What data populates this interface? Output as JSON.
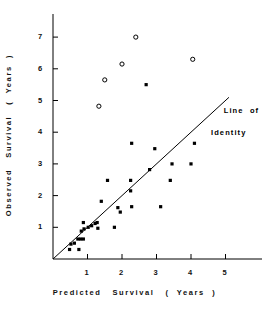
{
  "chart_data": {
    "type": "scatter",
    "title": "",
    "xlabel": "Predicted   Survival   (  Years  )",
    "ylabel": "Observed   Survival   (  Years  )",
    "xlim": [
      0,
      5.6
    ],
    "ylim": [
      0,
      7.35
    ],
    "xticks": [
      1,
      2,
      3,
      4,
      5
    ],
    "yticks": [
      1,
      2,
      3,
      4,
      5,
      6,
      7
    ],
    "xtick_labels": [
      "1",
      "2",
      "3",
      "4",
      "5"
    ],
    "ytick_labels": [
      "1",
      "2",
      "3",
      "4",
      "5",
      "6",
      "7"
    ],
    "grid": false,
    "legend": null,
    "annotations": [
      {
        "name": "line-of-identity",
        "line1": "Line  of",
        "line2": "Identity",
        "x": 4.6,
        "y": 5.05
      }
    ],
    "reference_line": {
      "name": "line-of-identity",
      "label": "Line of Identity",
      "slope": 1,
      "intercept": 0,
      "x_start": 0.0,
      "x_end": 5.1,
      "color": "#000000"
    },
    "series": [
      {
        "name": "Observed survival (filled)",
        "marker": "filled-square",
        "color": "#000000",
        "points": [
          [
            0.48,
            0.3
          ],
          [
            0.52,
            0.47
          ],
          [
            0.62,
            0.5
          ],
          [
            0.72,
            0.63
          ],
          [
            0.75,
            0.3
          ],
          [
            0.8,
            0.63
          ],
          [
            0.88,
            0.63
          ],
          [
            0.82,
            0.88
          ],
          [
            0.9,
            0.95
          ],
          [
            0.88,
            1.15
          ],
          [
            1.02,
            1.0
          ],
          [
            1.12,
            1.05
          ],
          [
            1.22,
            1.12
          ],
          [
            1.28,
            1.15
          ],
          [
            1.3,
            0.97
          ],
          [
            1.4,
            1.82
          ],
          [
            1.58,
            2.48
          ],
          [
            1.78,
            1.0
          ],
          [
            1.88,
            1.62
          ],
          [
            1.95,
            1.48
          ],
          [
            2.25,
            2.48
          ],
          [
            2.25,
            2.15
          ],
          [
            2.28,
            1.65
          ],
          [
            2.28,
            3.65
          ],
          [
            2.7,
            5.5
          ],
          [
            2.8,
            2.82
          ],
          [
            2.95,
            3.48
          ],
          [
            3.12,
            1.65
          ],
          [
            3.4,
            2.48
          ],
          [
            3.45,
            3.0
          ],
          [
            4.0,
            3.0
          ],
          [
            4.1,
            3.65
          ]
        ]
      },
      {
        "name": "Outliers (open)",
        "marker": "open-circle",
        "color": "#000000",
        "points": [
          [
            1.33,
            4.82
          ],
          [
            1.5,
            5.65
          ],
          [
            2.0,
            6.15
          ],
          [
            2.4,
            7.0
          ],
          [
            4.05,
            6.3
          ]
        ]
      }
    ]
  },
  "axes": {
    "x_title": "Predicted   Survival   (  Years  )",
    "y_title": "Observed   Survival   (  Years  )"
  }
}
